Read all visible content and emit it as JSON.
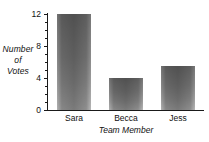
{
  "chart_data": {
    "type": "bar",
    "title": "",
    "subtitle": "",
    "categories": [
      "Sara",
      "Becca",
      "Jess"
    ],
    "values": [
      12,
      4,
      5.5
    ],
    "xlabel": "Team Member",
    "ylabel": "Number of Votes",
    "ylabel_lines": [
      "Number",
      "of",
      "Votes"
    ],
    "ylim": [
      0,
      12
    ],
    "xlim_categories": 3,
    "y_major_ticks": [
      0,
      4,
      8,
      12
    ],
    "y_major_tick_labels": [
      "0",
      "4",
      "8",
      "12"
    ],
    "y_minor_tick_step": 1,
    "grid": false,
    "legend": false,
    "legend_position": "none",
    "series": [
      {
        "name": "Votes",
        "values": [
          12,
          4,
          5.5
        ]
      }
    ],
    "colors": {
      "bar_fill_top": "#8f8f8f",
      "bar_fill_bottom": "#dcdcdc",
      "axis": "#1a1a1a",
      "text": "#111111",
      "background": "#ffffff"
    }
  }
}
